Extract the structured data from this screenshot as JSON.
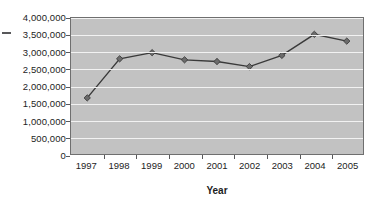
{
  "chart_data": {
    "type": "line",
    "title": "",
    "xlabel": "Year",
    "ylabel": "",
    "categories": [
      "1997",
      "1998",
      "1999",
      "2000",
      "2001",
      "2002",
      "2003",
      "2004",
      "2005"
    ],
    "values": [
      1650000,
      2800000,
      2980000,
      2770000,
      2720000,
      2570000,
      2900000,
      3520000,
      3320000
    ],
    "series": [
      {
        "name": "",
        "values": [
          1650000,
          2800000,
          2980000,
          2770000,
          2720000,
          2570000,
          2900000,
          3520000,
          3320000
        ]
      }
    ],
    "ylim": [
      0,
      4000000
    ],
    "ytick_values": [
      0,
      500000,
      1000000,
      1500000,
      2000000,
      2500000,
      3000000,
      3500000,
      4000000
    ],
    "ytick_labels": [
      "0",
      "500,000",
      "1,000,000",
      "1,500,000",
      "2,000,000",
      "2,500,000",
      "3,000,000",
      "3,500,000",
      "4,000,000"
    ],
    "grid": "horizontal",
    "legend": "none",
    "marker": "diamond",
    "colors": {
      "plot_background": "#c2c2c2",
      "gridline": "#f2f2f2",
      "line": "#3a3a3a",
      "marker": "#6b6b6b",
      "axis": "#58585a",
      "text": "#1d1d1d",
      "page_background": "#ffffff"
    }
  }
}
